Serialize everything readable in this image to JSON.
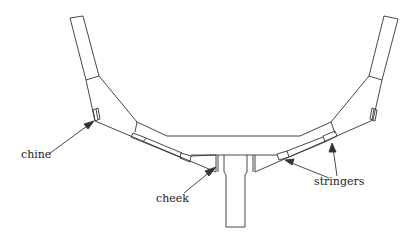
{
  "diagram": {
    "type": "boat hull cross-section",
    "labels": {
      "chine": "chine",
      "cheek": "cheek",
      "stringers": "stringers"
    },
    "line_color": "#333333"
  }
}
